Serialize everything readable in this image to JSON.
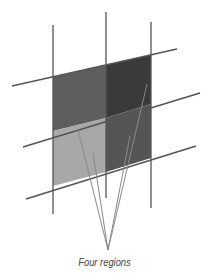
{
  "diagram": {
    "caption": "Four regions",
    "colors": {
      "grid_line": "#555555",
      "pointer_line": "#888888",
      "region_top_left": "#5e5e5e",
      "region_top_right": "#3a3a3a",
      "region_bottom_left": "#a8a8a8",
      "region_bottom_right": "#555555"
    },
    "regions": [
      {
        "name": "top-left"
      },
      {
        "name": "top-right"
      },
      {
        "name": "bottom-left"
      },
      {
        "name": "bottom-right"
      }
    ]
  }
}
